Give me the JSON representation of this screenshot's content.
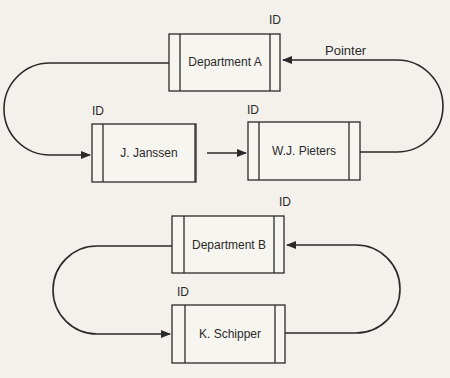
{
  "diagram": {
    "type": "linked-list-rings",
    "colors": {
      "line": "#2a2a2a",
      "background": "#f4f1ec",
      "box_fill": "#f7f5f0"
    },
    "rings": [
      {
        "nodes": [
          {
            "label": "Department A",
            "id_label": "ID"
          },
          {
            "label": "J. Janssen",
            "id_label": "ID"
          },
          {
            "label": "W.J. Pieters",
            "id_label": "ID"
          }
        ],
        "pointer_label": "Pointer",
        "edges": [
          {
            "from": "Department A",
            "to": "J. Janssen"
          },
          {
            "from": "J. Janssen",
            "to": "W.J. Pieters"
          },
          {
            "from": "W.J. Pieters",
            "to": "Department A"
          }
        ]
      },
      {
        "nodes": [
          {
            "label": "Department B",
            "id_label": "ID"
          },
          {
            "label": "K. Schipper",
            "id_label": "ID"
          }
        ],
        "edges": [
          {
            "from": "Department B",
            "to": "K. Schipper"
          },
          {
            "from": "K. Schipper",
            "to": "Department B"
          }
        ]
      }
    ]
  }
}
